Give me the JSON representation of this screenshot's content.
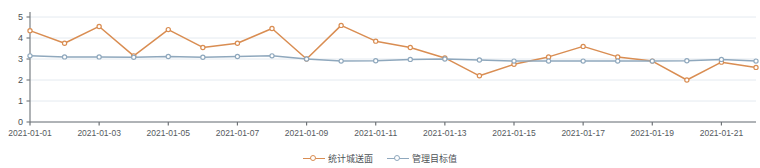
{
  "chart_data": {
    "type": "line",
    "title": "",
    "xlabel": "",
    "ylabel": "",
    "ylim": [
      0,
      5
    ],
    "yticks": [
      0,
      1,
      2,
      3,
      4,
      5
    ],
    "ytick_labels": [
      "0",
      "1",
      "2",
      "3",
      "4",
      "5"
    ],
    "grid": true,
    "legend_position": "bottom-center",
    "x": [
      "2021-01-01",
      "2021-01-02",
      "2021-01-03",
      "2021-01-04",
      "2021-01-05",
      "2021-01-06",
      "2021-01-07",
      "2021-01-08",
      "2021-01-09",
      "2021-01-10",
      "2021-01-11",
      "2021-01-12",
      "2021-01-13",
      "2021-01-14",
      "2021-01-15",
      "2021-01-16",
      "2021-01-17",
      "2021-01-18",
      "2021-01-19",
      "2021-01-20",
      "2021-01-21",
      "2021-01-22"
    ],
    "xtick_labels": [
      "2021-01-01",
      "2021-01-03",
      "2021-01-05",
      "2021-01-07",
      "2021-01-09",
      "2021-01-11",
      "2021-01-13",
      "2021-01-15",
      "2021-01-17",
      "2021-01-19",
      "2021-01-21"
    ],
    "xtick_indices": [
      0,
      2,
      4,
      6,
      8,
      10,
      12,
      14,
      16,
      18,
      20
    ],
    "series": [
      {
        "name": "统计城送面",
        "color": "#d98d52",
        "marker": "circle",
        "values": [
          4.35,
          3.75,
          4.55,
          3.15,
          4.4,
          3.55,
          3.75,
          4.45,
          3.0,
          4.6,
          3.85,
          3.55,
          3.05,
          2.2,
          2.75,
          3.1,
          3.6,
          3.1,
          2.9,
          2.0,
          2.85,
          2.6
        ]
      },
      {
        "name": "管理目标值",
        "color": "#8fa8bd",
        "marker": "circle",
        "values": [
          3.15,
          3.1,
          3.1,
          3.08,
          3.12,
          3.08,
          3.12,
          3.15,
          3.0,
          2.9,
          2.92,
          2.98,
          3.0,
          2.95,
          2.9,
          2.9,
          2.9,
          2.9,
          2.9,
          2.92,
          2.98,
          2.9
        ]
      }
    ]
  },
  "legend": {
    "items": [
      {
        "label": "统计城送面",
        "color": "#d98d52"
      },
      {
        "label": "管理目标值",
        "color": "#8fa8bd"
      }
    ]
  },
  "axes": {
    "y_axis_color": "#7a7f83",
    "x_axis_color": "#6e7377",
    "grid_color": "#e4eaf0"
  }
}
